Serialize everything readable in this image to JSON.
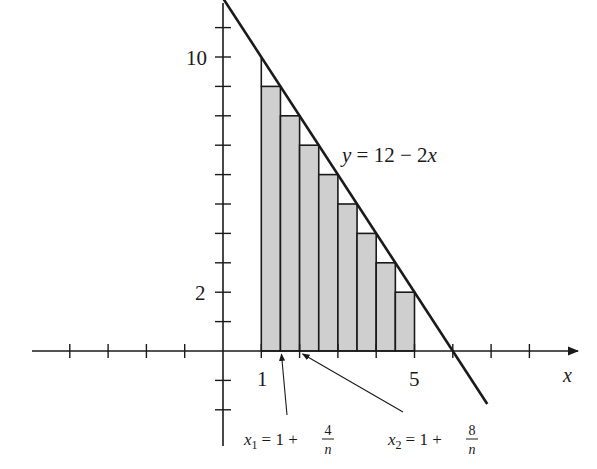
{
  "figure": {
    "function_label": "y = 12 − 2x",
    "x_axis_label": "x",
    "y_tick_labels": [
      {
        "value": 10,
        "text": "10"
      },
      {
        "value": 2,
        "text": "2"
      }
    ],
    "x_tick_labels": [
      {
        "value": 1,
        "text": "1"
      },
      {
        "value": 5,
        "text": "5"
      }
    ],
    "annotations": [
      {
        "id": "x1",
        "var": "x",
        "sub": "1",
        "rest": "= 1 +",
        "num": "4",
        "den": "n",
        "points_to": 1.5
      },
      {
        "id": "x2",
        "var": "x",
        "sub": "2",
        "rest": "= 1 +",
        "num": "8",
        "den": "n",
        "points_to": 2.0
      }
    ],
    "colors": {
      "ink": "#1a1a1a",
      "rect_fill": "#cfcfcf",
      "background": "#ffffff"
    }
  },
  "chart_data": {
    "type": "area",
    "title": "",
    "function": "y = 12 - 2x",
    "xlabel": "x",
    "ylabel": "",
    "xlim": [
      -5,
      9
    ],
    "ylim": [
      -3,
      12
    ],
    "x_ticks": [
      -4,
      -3,
      -2,
      -1,
      1,
      2,
      3,
      4,
      5,
      6,
      7,
      8
    ],
    "y_ticks": [
      -2,
      -1,
      1,
      2,
      3,
      4,
      5,
      6,
      7,
      8,
      9,
      10,
      11
    ],
    "line": {
      "x": [
        0,
        6.9
      ],
      "y": [
        12,
        -1.8
      ]
    },
    "rectangles": {
      "n": 8,
      "interval": [
        1,
        5
      ],
      "width": 0.5,
      "sample_point": "right endpoint",
      "left_edges": [
        1,
        1.5,
        2,
        2.5,
        3,
        3.5,
        4,
        4.5
      ],
      "heights": [
        9,
        8,
        7,
        6,
        5,
        4,
        3,
        2
      ]
    },
    "annotations": [
      "x1 = 1 + 4/n",
      "x2 = 1 + 8/n",
      "y = 12 − 2x"
    ],
    "grid": false
  }
}
